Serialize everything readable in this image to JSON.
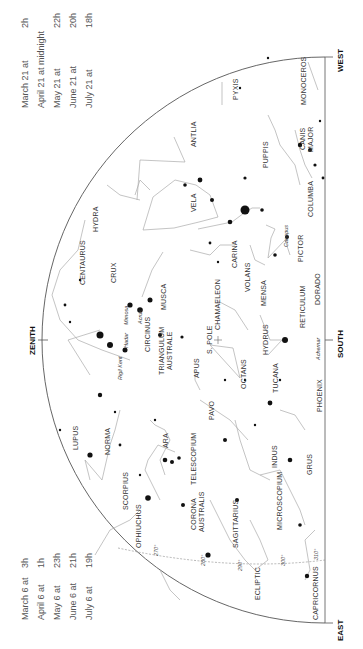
{
  "chart_title": "Southern sky star chart",
  "directions": {
    "west": "WEST",
    "south": "SOUTH",
    "east": "EAST",
    "zenith": "ZENITH"
  },
  "times_top": [
    {
      "date": "March 21 at",
      "time": "2h"
    },
    {
      "date": "April 21 at midnight",
      "time": ""
    },
    {
      "date": "May 21 at",
      "time": "22h"
    },
    {
      "date": "June 21 at",
      "time": "20h"
    },
    {
      "date": "July 21 at",
      "time": "18h"
    }
  ],
  "times_bottom": [
    {
      "date": "March 6 at",
      "time": "3h"
    },
    {
      "date": "April 6 at",
      "time": "1h"
    },
    {
      "date": "May 6 at",
      "time": "23h"
    },
    {
      "date": "June 6 at",
      "time": "21h"
    },
    {
      "date": "July 6 at",
      "time": "19h"
    }
  ],
  "constellations": {
    "monoceros": "MONOCEROS",
    "canis_major_1": "CANIS",
    "canis_major_2": "MAJOR",
    "pyxis": "PYXIS",
    "antlia": "ANTLIA",
    "puppis": "PUPPIS",
    "columba": "COLUMBA",
    "hydra": "HYDRA",
    "vela": "VELA",
    "carina": "CARINA",
    "pictor": "PICTOR",
    "dorado": "DORADO",
    "volans": "VOLANS",
    "mensa": "MENSA",
    "reticulum": "RETICULUM",
    "centaurus": "CENTAURUS",
    "crux": "CRUX",
    "musca": "MUSCA",
    "chamaeleon": "CHAMAELEON",
    "hydrus": "HYDRUS",
    "circinus": "CIRCINUS",
    "triangulum_1": "TRIANGULUM",
    "triangulum_2": "AUSTRALE",
    "apus": "APUS",
    "s_pole": "S. POLE",
    "octans": "OCTANS",
    "tucana": "TUCANA",
    "phoenix": "PHOENIX",
    "lupus": "LUPUS",
    "norma": "NORMA",
    "ara": "ARA",
    "pavo": "PAVO",
    "indus": "INDUS",
    "grus": "GRUS",
    "scorpius": "SCORPIUS",
    "telescopium": "TELESCOPIUM",
    "ophiuchus": "OPHIUCHUS",
    "corona_1": "CORONA",
    "corona_2": "AUSTRALIS",
    "sagittarius": "SAGITTARIUS",
    "microscopium": "MICROSCOPIUM",
    "capricornus": "CAPRICORNUS",
    "ecliptic": "ECLIPTIC"
  },
  "star_names": {
    "canopus": "Canopus",
    "achernar": "Achernar",
    "rigil_kent": "Rigil Kent",
    "hadar": "Hadar",
    "mimosa": "Mimosa",
    "acrux": "Acrux"
  },
  "ecliptic_degrees": [
    "270°",
    "280°",
    "290°",
    "300°",
    "310°"
  ]
}
